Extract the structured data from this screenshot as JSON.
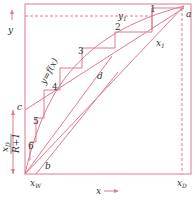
{
  "diagram": {
    "type": "McCabe-Thiele distillation diagram",
    "colors": {
      "line": "#e07a8c",
      "text": "#333333"
    },
    "axes": {
      "x_label": "x",
      "y_label": "y"
    },
    "curve_label": "y=f(x)",
    "points": {
      "a": "a",
      "b": "b",
      "c": "c",
      "d": "d"
    },
    "stage_labels": [
      "1",
      "2",
      "3",
      "4",
      "5",
      "6"
    ],
    "annotations": {
      "y1": "y",
      "y1_sub": "1",
      "x1": "x",
      "x1_sub": "1",
      "xD": "x",
      "xD_sub": "D",
      "xW": "x",
      "xW_sub": "W",
      "intercept_num": "x",
      "intercept_num_sub": "D",
      "intercept_den": "R+1"
    }
  }
}
